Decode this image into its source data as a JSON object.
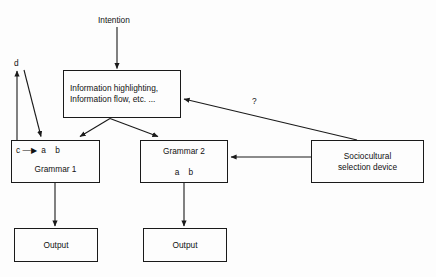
{
  "diagram": {
    "type": "flowchart",
    "background_color": "#fdfdfd",
    "stroke_color": "#1a1a1a",
    "text_color": "#111111",
    "labels": {
      "intention": "Intention",
      "d_label": "d",
      "question_mark": "?"
    },
    "nodes": [
      {
        "id": "information",
        "lines": [
          "Information highlighting,",
          "Information flow, etc. ..."
        ]
      },
      {
        "id": "grammar1",
        "lines": [
          "c —▶  a    b",
          "Grammar 1"
        ]
      },
      {
        "id": "grammar2",
        "lines": [
          "Grammar 2",
          "a    b"
        ]
      },
      {
        "id": "sociocultural",
        "lines": [
          "Sociocultural",
          "selection device"
        ]
      },
      {
        "id": "output_left",
        "lines": [
          "Output"
        ]
      },
      {
        "id": "output_right",
        "lines": [
          "Output"
        ]
      }
    ],
    "edges": [
      {
        "from": "intention",
        "to": "information",
        "style": "straight-down"
      },
      {
        "from": "information",
        "to": "grammar1",
        "style": "diagonal-left"
      },
      {
        "from": "information",
        "to": "grammar2",
        "style": "diagonal-right"
      },
      {
        "from": "grammar1",
        "to": "output_left",
        "style": "straight-down"
      },
      {
        "from": "grammar2",
        "to": "output_right",
        "style": "straight-down"
      },
      {
        "from": "sociocultural",
        "to": "grammar2",
        "style": "horizontal-left"
      },
      {
        "from": "sociocultural",
        "to": "information",
        "style": "diagonal-up-left",
        "label": "?"
      },
      {
        "from": "grammar1",
        "to": "d_label",
        "style": "straight-up"
      },
      {
        "from": "d_label",
        "to": "grammar1",
        "style": "diagonal-down-right"
      }
    ]
  }
}
